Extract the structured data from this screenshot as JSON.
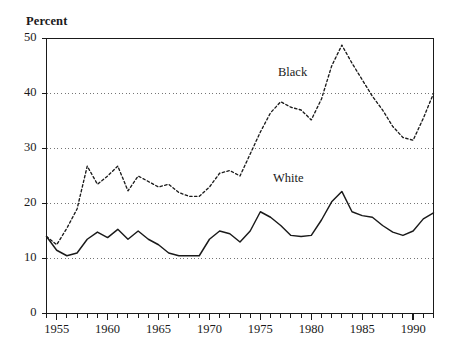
{
  "chart_data": {
    "type": "line",
    "title": "",
    "ylabel": "Percent",
    "xlabel": "",
    "xlim": [
      1954,
      1992
    ],
    "ylim": [
      0,
      50
    ],
    "grid": "horizontal-dotted",
    "ytick_values": [
      0,
      10,
      20,
      30,
      40,
      50
    ],
    "ytick_labels": [
      "0",
      "10",
      "20",
      "30",
      "40",
      "50"
    ],
    "xtick_values": [
      1955,
      1960,
      1965,
      1970,
      1975,
      1980,
      1985,
      1990
    ],
    "xtick_labels": [
      "1955",
      "1960",
      "1965",
      "1970",
      "1975",
      "1980",
      "1985",
      "1990"
    ],
    "xtick_minor_step": 1,
    "gridline_values": [
      10,
      20,
      30,
      40
    ],
    "legend_position": "inline-annotations",
    "x": [
      1954,
      1955,
      1956,
      1957,
      1958,
      1959,
      1960,
      1961,
      1962,
      1963,
      1964,
      1965,
      1966,
      1967,
      1968,
      1969,
      1970,
      1971,
      1972,
      1973,
      1974,
      1975,
      1976,
      1977,
      1978,
      1979,
      1980,
      1981,
      1982,
      1983,
      1984,
      1985,
      1986,
      1987,
      1988,
      1989,
      1990,
      1991,
      1992
    ],
    "series": [
      {
        "name": "Black",
        "style": "dashed",
        "color": "#1a1a1a",
        "label_x": 1978.5,
        "label_y": 43.5,
        "values": [
          14.0,
          12.5,
          15.5,
          19.0,
          26.8,
          23.5,
          25.0,
          26.8,
          22.3,
          25.0,
          24.0,
          23.0,
          23.5,
          22.0,
          21.3,
          21.3,
          23.0,
          25.5,
          26.0,
          25.0,
          29.0,
          33.0,
          36.5,
          38.5,
          37.5,
          37.0,
          35.2,
          39.0,
          45.0,
          48.8,
          45.5,
          42.5,
          39.5,
          37.0,
          34.0,
          32.0,
          31.5,
          35.5,
          40.0
        ]
      },
      {
        "name": "White",
        "style": "solid",
        "color": "#1a1a1a",
        "label_x": 1978.0,
        "label_y": 24.3,
        "values": [
          14.0,
          11.5,
          10.5,
          11.0,
          13.5,
          14.8,
          13.8,
          15.3,
          13.5,
          15.0,
          13.5,
          12.5,
          11.0,
          10.5,
          10.5,
          10.5,
          13.5,
          15.0,
          14.5,
          13.0,
          15.0,
          18.5,
          17.5,
          16.0,
          14.2,
          14.0,
          14.2,
          17.0,
          20.3,
          22.2,
          18.5,
          17.8,
          17.5,
          16.0,
          14.8,
          14.2,
          15.0,
          17.2,
          18.3
        ]
      }
    ]
  },
  "annotations": {
    "percent_label": "Percent"
  }
}
